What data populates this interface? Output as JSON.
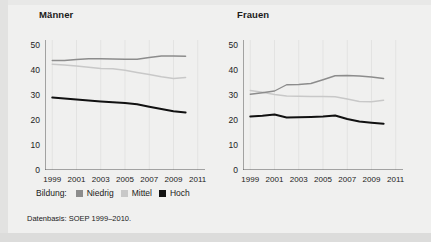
{
  "figure": {
    "source_note": "Datenbasis: SOEP 1999–2010.",
    "legend": {
      "title": "Bildung:",
      "entries": [
        {
          "label": "Niedrig",
          "color": "#8c8c8c"
        },
        {
          "label": "Mittel",
          "color": "#c8c8c8"
        },
        {
          "label": "Hoch",
          "color": "#111111"
        }
      ]
    }
  },
  "chart_data": [
    {
      "type": "line",
      "title": "Männer",
      "xlabel": "",
      "ylabel": "",
      "x": [
        1999,
        2000,
        2001,
        2002,
        2003,
        2004,
        2005,
        2006,
        2007,
        2008,
        2009,
        2010
      ],
      "xlim": [
        1998.4,
        2011.6
      ],
      "ylim": [
        0,
        52
      ],
      "xticks": [
        1999,
        2001,
        2003,
        2005,
        2007,
        2009,
        2011
      ],
      "yticks": [
        0,
        10,
        20,
        30,
        40,
        50
      ],
      "grid": true,
      "legend_position": "bottom",
      "series": [
        {
          "name": "Niedrig",
          "color": "#8c8c8c",
          "values": [
            43.8,
            43.8,
            44.2,
            44.5,
            44.5,
            44.4,
            44.3,
            44.3,
            45.0,
            45.6,
            45.6,
            45.5
          ]
        },
        {
          "name": "Mittel",
          "color": "#c8c8c8",
          "values": [
            42.3,
            42.0,
            41.6,
            41.1,
            40.6,
            40.5,
            39.9,
            39.0,
            38.2,
            37.3,
            36.6,
            37.0
          ]
        },
        {
          "name": "Hoch",
          "color": "#111111",
          "values": [
            29.0,
            28.6,
            28.2,
            27.8,
            27.4,
            27.1,
            26.8,
            26.3,
            25.3,
            24.4,
            23.5,
            23.0
          ]
        }
      ]
    },
    {
      "type": "line",
      "title": "Frauen",
      "xlabel": "",
      "ylabel": "",
      "x": [
        1999,
        2000,
        2001,
        2002,
        2003,
        2004,
        2005,
        2006,
        2007,
        2008,
        2009,
        2010
      ],
      "xlim": [
        1998.4,
        2011.6
      ],
      "ylim": [
        0,
        52
      ],
      "xticks": [
        1999,
        2001,
        2003,
        2005,
        2007,
        2009,
        2011
      ],
      "yticks": [
        0,
        10,
        20,
        30,
        40,
        50
      ],
      "grid": true,
      "legend_position": "bottom",
      "series": [
        {
          "name": "Niedrig",
          "color": "#8c8c8c",
          "values": [
            30.3,
            30.9,
            31.6,
            34.1,
            34.2,
            34.6,
            36.1,
            37.7,
            37.8,
            37.6,
            37.2,
            36.6
          ]
        },
        {
          "name": "Mittel",
          "color": "#c8c8c8",
          "values": [
            31.8,
            31.1,
            30.2,
            29.6,
            29.5,
            29.4,
            29.4,
            29.3,
            28.4,
            27.4,
            27.3,
            27.9
          ]
        },
        {
          "name": "Hoch",
          "color": "#111111",
          "values": [
            21.4,
            21.7,
            22.2,
            21.0,
            21.1,
            21.2,
            21.4,
            21.8,
            20.4,
            19.4,
            18.9,
            18.5
          ]
        }
      ]
    }
  ]
}
